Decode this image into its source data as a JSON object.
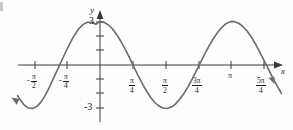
{
  "figure": {
    "axis_labels": {
      "x": "x",
      "y": "y"
    },
    "y_tick_labels": {
      "positive": "3",
      "negative": "-3"
    },
    "x_tick_labels": [
      {
        "sign": "−",
        "numerator": "π",
        "denominator": "2"
      },
      {
        "sign": "−",
        "numerator": "π",
        "denominator": "4"
      },
      {
        "sign": "",
        "numerator": "π",
        "denominator": "4"
      },
      {
        "sign": "",
        "numerator": "π",
        "denominator": "2"
      },
      {
        "sign": "",
        "numerator": "3π",
        "denominator": "4"
      },
      {
        "sign": "",
        "numerator": "π",
        "denominator": ""
      },
      {
        "sign": "",
        "numerator": "5π",
        "denominator": "4"
      }
    ],
    "colors": {
      "curve": "#6b6b6b",
      "axis": "#3a3a3a",
      "text": "#1c1c1c",
      "background": "#fdfdfd"
    }
  },
  "chart_data": {
    "type": "line",
    "title": "",
    "xlabel": "x",
    "ylabel": "y",
    "function": "y = 3 cos(2x)",
    "amplitude": 3,
    "period": "π",
    "xlim": [
      -1.963,
      4.32
    ],
    "ylim": [
      -3.9,
      3.9
    ],
    "grid": false,
    "legend": null,
    "x_ticks": [
      -1.5708,
      -0.7854,
      0.7854,
      1.5708,
      2.3562,
      3.1416,
      3.927
    ],
    "x_tick_text": [
      "-π/2",
      "-π/4",
      "π/4",
      "π/2",
      "3π/4",
      "π",
      "5π/4"
    ],
    "y_ticks": [
      -3,
      -2,
      -1,
      1,
      2,
      3
    ],
    "y_tick_text": [
      "-3",
      "",
      "",
      "",
      "",
      "3"
    ],
    "key_points": [
      {
        "x": -1.5708,
        "y": -3,
        "note": "minimum"
      },
      {
        "x": -0.7854,
        "y": 0,
        "note": "zero"
      },
      {
        "x": 0,
        "y": 3,
        "note": "maximum"
      },
      {
        "x": 0.7854,
        "y": 0,
        "note": "zero"
      },
      {
        "x": 1.5708,
        "y": -3,
        "note": "minimum"
      },
      {
        "x": 2.3562,
        "y": 0,
        "note": "zero"
      },
      {
        "x": 3.1416,
        "y": 3,
        "note": "maximum"
      },
      {
        "x": 3.927,
        "y": 0,
        "note": "zero"
      }
    ],
    "x": [
      -1.963,
      -1.9,
      -1.8,
      -1.7,
      -1.6,
      -1.5,
      -1.4,
      -1.3,
      -1.2,
      -1.1,
      -1.0,
      -0.9,
      -0.8,
      -0.7,
      -0.6,
      -0.5,
      -0.4,
      -0.3,
      -0.2,
      -0.1,
      0.0,
      0.1,
      0.2,
      0.3,
      0.4,
      0.5,
      0.6,
      0.7,
      0.8,
      0.9,
      1.0,
      1.1,
      1.2,
      1.3,
      1.4,
      1.5,
      1.6,
      1.7,
      1.8,
      1.9,
      2.0,
      2.1,
      2.2,
      2.3,
      2.4,
      2.5,
      2.6,
      2.7,
      2.8,
      2.9,
      3.0,
      3.1,
      3.2,
      3.3,
      3.4,
      3.5,
      3.6,
      3.7,
      3.8,
      3.9,
      4.0,
      4.1,
      4.2,
      4.32
    ],
    "y": [
      -2.12,
      -2.39,
      -2.77,
      -2.97,
      -3.0,
      -2.85,
      -2.54,
      -2.08,
      -1.51,
      -0.87,
      -0.25,
      0.38,
      1.0,
      1.58,
      2.09,
      2.52,
      2.8,
      2.95,
      2.95,
      2.81,
      3.0,
      2.94,
      2.76,
      2.48,
      2.09,
      1.62,
      1.09,
      0.51,
      -0.09,
      -0.69,
      -1.25,
      -1.76,
      -2.21,
      -2.57,
      -2.83,
      -2.97,
      -3.0,
      -2.9,
      -2.68,
      -2.35,
      -1.96,
      -1.48,
      -0.94,
      -0.37,
      0.21,
      0.8,
      1.34,
      1.83,
      2.26,
      2.6,
      2.85,
      2.99,
      2.99,
      2.88,
      2.66,
      2.34,
      1.93,
      1.45,
      0.91,
      0.34,
      -0.24,
      -0.82,
      -1.36,
      -1.97
    ]
  }
}
